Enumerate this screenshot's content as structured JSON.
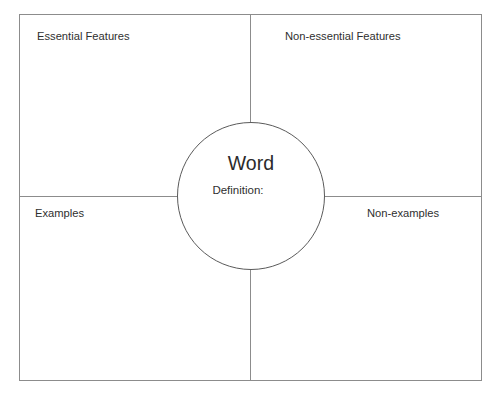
{
  "document": {
    "title": "Frayer Model Graphic Organizer",
    "background_color": "#ffffff",
    "line_color": "#8c8c8c",
    "circle_line_color": "#5a5a5a",
    "text_color": "#2f2f2f"
  },
  "center": {
    "word_label": "Word",
    "definition_label": "Definition:"
  },
  "quadrants": [
    {
      "id": "top-left",
      "label": "Essential Features"
    },
    {
      "id": "top-right",
      "label": "Non-essential Features"
    },
    {
      "id": "bottom-left",
      "label": "Examples"
    },
    {
      "id": "bottom-right",
      "label": "Non-examples"
    }
  ]
}
